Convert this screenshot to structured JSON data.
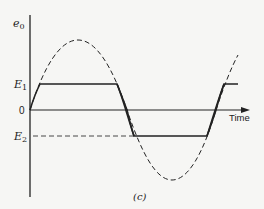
{
  "figure": {
    "caption": "(c)",
    "y_axis_label": "e",
    "y_axis_label_sub": "0",
    "x_axis_label": "Time",
    "zero_label": "0",
    "level_upper_label": "E",
    "level_upper_sub": "1",
    "level_lower_label": "E",
    "level_lower_sub": "2"
  },
  "colors": {
    "background": "#f6f6f4",
    "ink": "#222222"
  }
}
